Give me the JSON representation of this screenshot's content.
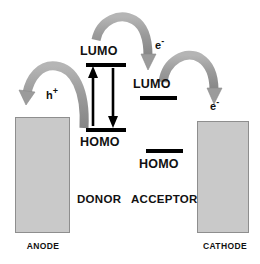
{
  "diagram": {
    "background_color": "#ffffff",
    "electrode_fill": "#c9c9c9",
    "electrode_stroke": "#8e8e8e",
    "arrow_color": "#9a9a9a",
    "level_color": "#000000"
  },
  "electrodes": {
    "anode": {
      "label": "ANODE"
    },
    "cathode": {
      "label": "CATHODE"
    }
  },
  "materials": {
    "donor": {
      "name": "DONOR",
      "lumo_label": "LUMO",
      "homo_label": "HOMO"
    },
    "acceptor": {
      "name": "ACCEPTOR",
      "lumo_label": "LUMO",
      "homo_label": "HOMO"
    }
  },
  "carriers": {
    "hole": {
      "symbol": "h",
      "charge": "+"
    },
    "electron_1": {
      "symbol": "e",
      "charge": "-"
    },
    "electron_2": {
      "symbol": "e",
      "charge": "-"
    }
  },
  "arrows": {
    "hole_transfer_to_anode": "curved-arrow-left",
    "electron_transfer_donor_to_acceptor": "curved-arrow-middle",
    "electron_transfer_to_cathode": "curved-arrow-right",
    "excitation_up": "straight-arrow-up",
    "recombination_down": "straight-arrow-down"
  }
}
